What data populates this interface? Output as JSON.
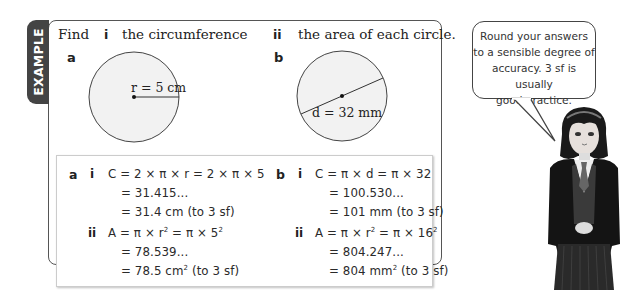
{
  "example_tab": {
    "label": "EXAMPLE",
    "color": "#444444"
  },
  "question": {
    "find": "Find",
    "part_i_label": "i",
    "part_i_text": "the circumference",
    "part_ii_label": "ii",
    "part_ii_text": "the area of each circle.",
    "circle_a": {
      "label": "a",
      "measure_label": "r = 5 cm",
      "measure_type": "radius"
    },
    "circle_b": {
      "label": "b",
      "measure_label": "d = 32 mm",
      "measure_type": "diameter"
    }
  },
  "solution": {
    "a": {
      "label": "a",
      "i": {
        "label": "i",
        "lines": [
          "C = 2 × π × r = 2 × π × 5",
          "= 31.415...",
          "= 31.4 cm (to 3 sf)"
        ]
      },
      "ii": {
        "label": "ii",
        "line1_pre": "A = π × r",
        "line1_sup1": "2",
        "line1_mid": " = π × 5",
        "line1_sup2": "2",
        "line2": "= 78.539...",
        "line3_pre": "= 78.5 cm",
        "line3_sup": "2",
        "line3_post": " (to 3 sf)"
      }
    },
    "b": {
      "label": "b",
      "i": {
        "label": "i",
        "lines": [
          "C = π × d = π × 32",
          "= 100.530...",
          "= 101 mm (to 3 sf)"
        ]
      },
      "ii": {
        "label": "ii",
        "line1_pre": "A = π × r",
        "line1_sup1": "2",
        "line1_mid": " = π × 16",
        "line1_sup2": "2",
        "line2": "= 804.247...",
        "line3_pre": "= 804 mm",
        "line3_sup": "2",
        "line3_post": " (to 3 sf)"
      }
    }
  },
  "speech_bubble": {
    "lines": [
      "Round your answers",
      "to a sensible degree of",
      "accuracy. 3 sf is usually",
      "good practice."
    ]
  },
  "character": {
    "description": "student in school uniform"
  }
}
